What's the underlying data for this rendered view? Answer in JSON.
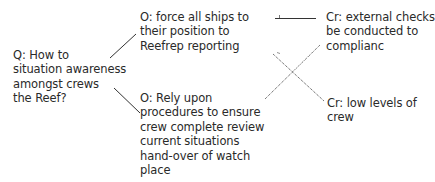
{
  "diagram": {
    "type": "qoc-design-rationale",
    "question": {
      "lines": [
        "Q: How to",
        "situation awareness",
        "amongst crews",
        "the Reef?"
      ]
    },
    "options": [
      {
        "lines": [
          "O: force all ships to",
          "their position to",
          "Reefrep reporting"
        ]
      },
      {
        "lines": [
          "O: Rely upon",
          "procedures to ensure",
          "crew complete review",
          "current situations",
          "hand-over of watch",
          "place"
        ]
      }
    ],
    "criteria": [
      {
        "lines": [
          "Cr: external checks",
          "be conducted to",
          "complianc"
        ]
      },
      {
        "lines": [
          "Cr: low levels of",
          "crew"
        ]
      }
    ],
    "links": [
      {
        "from": "question",
        "to": "option-1",
        "style": "solid"
      },
      {
        "from": "question",
        "to": "option-2",
        "style": "solid"
      },
      {
        "from": "option-1",
        "to": "criterion-1",
        "style": "solid",
        "polarity": "positive"
      },
      {
        "from": "option-2",
        "to": "criterion-1",
        "style": "dotted",
        "polarity": "negative"
      },
      {
        "from": "option-1",
        "to": "criterion-2",
        "style": "dotted",
        "polarity": "negative"
      }
    ],
    "colors": {
      "text": "#2a2a2a",
      "line": "#333333",
      "background": "#ffffff"
    }
  }
}
